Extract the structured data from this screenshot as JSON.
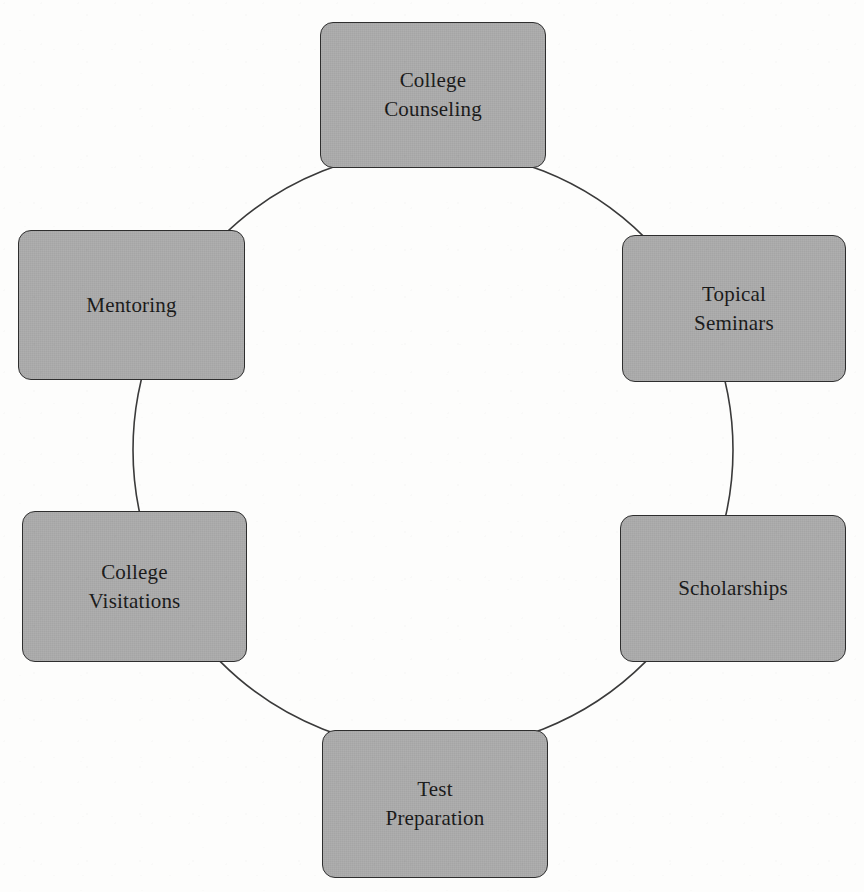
{
  "diagram": {
    "type": "cycle",
    "shape": "circle",
    "style": {
      "node_fill": "#a9a9a9",
      "node_border": "#2e2e2e",
      "ring_stroke": "#3a3a3a",
      "text_color": "#141414",
      "background": "#fdfdfc"
    },
    "ring": {
      "center_x": 433,
      "center_y": 450,
      "radius": 300,
      "stroke_width": 1.6
    },
    "nodes": [
      {
        "id": "college-counseling",
        "label": "College\nCounseling",
        "line1": "College",
        "line2": "Counseling",
        "position": "top",
        "x": 320,
        "y": 22,
        "width": 226,
        "height": 146
      },
      {
        "id": "topical-seminars",
        "label": "Topical\nSeminars",
        "line1": "Topical",
        "line2": "Seminars",
        "position": "upper-right",
        "x": 622,
        "y": 235,
        "width": 224,
        "height": 147
      },
      {
        "id": "scholarships",
        "label": "Scholarships",
        "line1": "Scholarships",
        "line2": "",
        "position": "lower-right",
        "x": 620,
        "y": 515,
        "width": 226,
        "height": 147
      },
      {
        "id": "test-preparation",
        "label": "Test\nPreparation",
        "line1": "Test",
        "line2": "Preparation",
        "position": "bottom",
        "x": 322,
        "y": 730,
        "width": 226,
        "height": 148
      },
      {
        "id": "college-visitations",
        "label": "College\nVisitations",
        "line1": "College",
        "line2": "Visitations",
        "position": "lower-left",
        "x": 22,
        "y": 511,
        "width": 225,
        "height": 151
      },
      {
        "id": "mentoring",
        "label": "Mentoring",
        "line1": "Mentoring",
        "line2": "",
        "position": "upper-left",
        "x": 18,
        "y": 230,
        "width": 227,
        "height": 150
      }
    ]
  }
}
